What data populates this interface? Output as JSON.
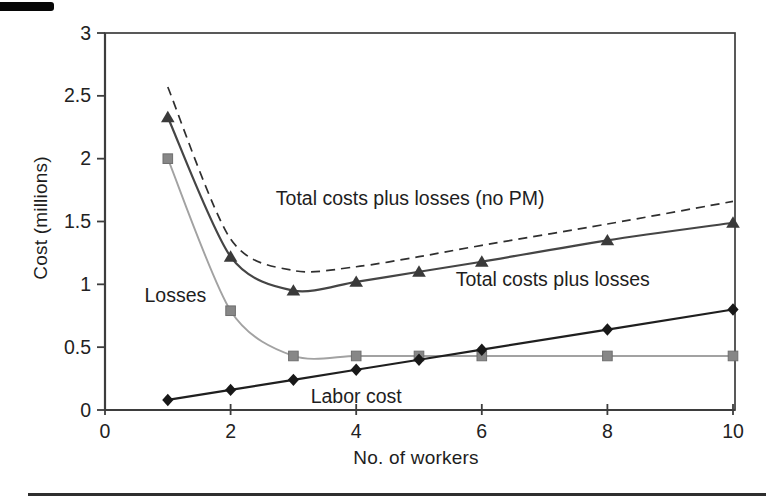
{
  "page": {
    "background": "#ffffff",
    "artifacts": {
      "top_left_bar_color": "#070707",
      "bottom_rule_color": "#2e2e2e"
    }
  },
  "chart_data": {
    "type": "line",
    "title": "",
    "xlabel": "No. of workers",
    "ylabel": "Cost (millions)",
    "xlim": [
      0,
      10
    ],
    "ylim": [
      0,
      3
    ],
    "x_ticks": [
      0,
      2,
      4,
      6,
      8,
      10
    ],
    "y_ticks": [
      0,
      0.5,
      1,
      1.5,
      2,
      2.5,
      3
    ],
    "grid": false,
    "legend_position": "inline-annotations",
    "axis_color": "#3d3d3d",
    "tick_label_color": "#222222",
    "x": [
      1,
      2,
      3,
      4,
      5,
      6,
      8,
      10
    ],
    "series": [
      {
        "name": "Total costs plus losses (no PM)",
        "values": [
          2.57,
          1.36,
          1.11,
          1.14,
          1.22,
          1.31,
          1.48,
          1.66
        ],
        "line": "dashed",
        "smooth": true,
        "marker": "none",
        "color": "#2f2f2f",
        "width": 1.7
      },
      {
        "name": "Total costs plus losses",
        "values": [
          2.33,
          1.22,
          0.95,
          1.02,
          1.1,
          1.18,
          1.35,
          1.49
        ],
        "line": "solid",
        "smooth": true,
        "marker": "triangle",
        "color": "#454545",
        "marker_color": "#3a3a3a",
        "width": 2.2
      },
      {
        "name": "Losses",
        "values": [
          2.0,
          0.79,
          0.43,
          0.43,
          0.43,
          0.43,
          0.43,
          0.43
        ],
        "line": "solid",
        "smooth": true,
        "marker": "square",
        "color": "#a2a2a2",
        "marker_color": "#878787",
        "width": 1.9
      },
      {
        "name": "Labor cost",
        "values": [
          0.08,
          0.16,
          0.24,
          0.32,
          0.4,
          0.48,
          0.64,
          0.8
        ],
        "line": "solid",
        "smooth": false,
        "marker": "diamond",
        "color": "#1f1f1f",
        "marker_color": "#181818",
        "width": 2.2
      }
    ],
    "annotations": [
      {
        "text": "Total costs plus losses (no PM)",
        "x": 4.86,
        "y": 1.68
      },
      {
        "text": "Total costs plus losses",
        "x": 7.13,
        "y": 1.04
      },
      {
        "text": "Losses",
        "x": 1.12,
        "y": 0.91
      },
      {
        "text": "Labor cost",
        "x": 4.0,
        "y": 0.11
      }
    ]
  }
}
